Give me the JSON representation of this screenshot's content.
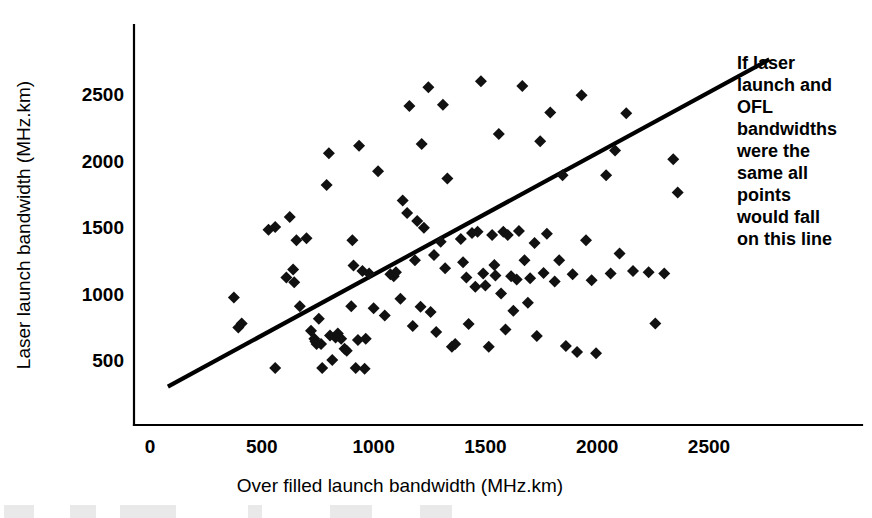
{
  "figure": {
    "annotation": "If laser\nlaunch and\nOFL\nbandwidths\nwere the\nsame all\npoints\nwould fall\non this line"
  },
  "chart_data": {
    "type": "scatter",
    "title": "",
    "xlabel": "Over filled launch bandwidth (MHz.km)",
    "ylabel": "Laser launch bandwidth (MHz.km)",
    "xlim": [
      0,
      2800
    ],
    "ylim": [
      250,
      2800
    ],
    "xticks": [
      0,
      500,
      1000,
      1500,
      2000,
      2500
    ],
    "xtick_labels": [
      "0",
      "500",
      "1000",
      "1500",
      "2000",
      "2500"
    ],
    "yticks": [
      500,
      1000,
      1500,
      2000,
      2500
    ],
    "ytick_labels": [
      "500",
      "1000",
      "1500",
      "2000",
      "2500"
    ],
    "grid": false,
    "legend": null,
    "marker": "diamond",
    "marker_color": "#111111",
    "reference_line": {
      "label": "y = x (identity line)",
      "x": [
        80,
        2770
      ],
      "y": [
        300,
        2760
      ],
      "color": "#000000"
    },
    "annotations": [
      {
        "text": "If laser launch and OFL bandwidths were the same all points would fall on this line",
        "x": 2600,
        "y": 2400
      }
    ],
    "points": [
      [
        375,
        970
      ],
      [
        395,
        745
      ],
      [
        410,
        775
      ],
      [
        530,
        1480
      ],
      [
        560,
        1500
      ],
      [
        560,
        440
      ],
      [
        610,
        1120
      ],
      [
        625,
        1575
      ],
      [
        640,
        1180
      ],
      [
        645,
        1085
      ],
      [
        655,
        1400
      ],
      [
        670,
        905
      ],
      [
        700,
        1415
      ],
      [
        720,
        720
      ],
      [
        735,
        660
      ],
      [
        740,
        640
      ],
      [
        745,
        620
      ],
      [
        755,
        810
      ],
      [
        765,
        620
      ],
      [
        770,
        440
      ],
      [
        790,
        1815
      ],
      [
        800,
        2055
      ],
      [
        805,
        685
      ],
      [
        815,
        500
      ],
      [
        830,
        670
      ],
      [
        840,
        700
      ],
      [
        855,
        660
      ],
      [
        870,
        585
      ],
      [
        880,
        570
      ],
      [
        900,
        905
      ],
      [
        905,
        1400
      ],
      [
        910,
        1210
      ],
      [
        920,
        440
      ],
      [
        930,
        650
      ],
      [
        935,
        2110
      ],
      [
        950,
        1170
      ],
      [
        960,
        435
      ],
      [
        965,
        660
      ],
      [
        980,
        1150
      ],
      [
        1000,
        890
      ],
      [
        1020,
        1920
      ],
      [
        1050,
        835
      ],
      [
        1075,
        1145
      ],
      [
        1090,
        1130
      ],
      [
        1100,
        1160
      ],
      [
        1120,
        960
      ],
      [
        1130,
        1700
      ],
      [
        1150,
        1605
      ],
      [
        1160,
        2410
      ],
      [
        1175,
        755
      ],
      [
        1185,
        1250
      ],
      [
        1195,
        1545
      ],
      [
        1210,
        900
      ],
      [
        1215,
        2125
      ],
      [
        1225,
        1495
      ],
      [
        1245,
        2550
      ],
      [
        1255,
        860
      ],
      [
        1270,
        1290
      ],
      [
        1280,
        710
      ],
      [
        1300,
        1390
      ],
      [
        1310,
        2420
      ],
      [
        1320,
        1190
      ],
      [
        1330,
        1865
      ],
      [
        1350,
        600
      ],
      [
        1365,
        620
      ],
      [
        1390,
        1410
      ],
      [
        1400,
        1235
      ],
      [
        1415,
        1120
      ],
      [
        1425,
        770
      ],
      [
        1440,
        1455
      ],
      [
        1455,
        1050
      ],
      [
        1465,
        1465
      ],
      [
        1480,
        2595
      ],
      [
        1490,
        1150
      ],
      [
        1500,
        1060
      ],
      [
        1515,
        600
      ],
      [
        1530,
        1440
      ],
      [
        1540,
        1215
      ],
      [
        1545,
        1135
      ],
      [
        1560,
        2200
      ],
      [
        1570,
        1000
      ],
      [
        1580,
        1465
      ],
      [
        1590,
        730
      ],
      [
        1600,
        1440
      ],
      [
        1615,
        1130
      ],
      [
        1625,
        870
      ],
      [
        1640,
        1105
      ],
      [
        1650,
        1470
      ],
      [
        1665,
        2560
      ],
      [
        1675,
        1250
      ],
      [
        1690,
        930
      ],
      [
        1700,
        1115
      ],
      [
        1720,
        1380
      ],
      [
        1730,
        680
      ],
      [
        1745,
        2145
      ],
      [
        1760,
        1155
      ],
      [
        1775,
        1450
      ],
      [
        1790,
        2360
      ],
      [
        1810,
        1090
      ],
      [
        1830,
        1250
      ],
      [
        1845,
        1890
      ],
      [
        1860,
        605
      ],
      [
        1890,
        1145
      ],
      [
        1910,
        560
      ],
      [
        1930,
        2490
      ],
      [
        1950,
        1400
      ],
      [
        1975,
        1100
      ],
      [
        1995,
        550
      ],
      [
        2040,
        1890
      ],
      [
        2060,
        1150
      ],
      [
        2080,
        2075
      ],
      [
        2100,
        1300
      ],
      [
        2130,
        2355
      ],
      [
        2160,
        1170
      ],
      [
        2230,
        1160
      ],
      [
        2260,
        775
      ],
      [
        2300,
        1150
      ],
      [
        2340,
        2010
      ],
      [
        2360,
        1760
      ]
    ]
  }
}
